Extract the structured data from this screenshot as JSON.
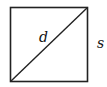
{
  "diagram": {
    "shape": "square",
    "diagonal_label": "d",
    "side_label": "s",
    "stroke_color": "#222222"
  }
}
